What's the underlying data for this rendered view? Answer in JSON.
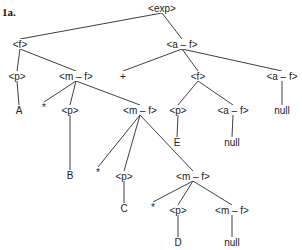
{
  "figure_label": "1a.",
  "nodes": {
    "root": {
      "label": "<exp>",
      "x": 162,
      "y": 8
    },
    "f1": {
      "label": "<f>",
      "x": 20,
      "y": 44
    },
    "af1": {
      "label": "<a – f>",
      "x": 182,
      "y": 44
    },
    "p1": {
      "label": "<p>",
      "x": 17,
      "y": 76
    },
    "mf1": {
      "label": "<m – f>",
      "x": 76,
      "y": 76
    },
    "plus": {
      "label": "+",
      "x": 123,
      "y": 76
    },
    "f2": {
      "label": "<f>",
      "x": 198,
      "y": 76
    },
    "af2": {
      "label": "<a – f>",
      "x": 282,
      "y": 76
    },
    "A": {
      "label": "A",
      "x": 19,
      "y": 110
    },
    "star1": {
      "label": "*",
      "x": 44,
      "y": 107
    },
    "p2": {
      "label": "<p>",
      "x": 70,
      "y": 110
    },
    "mf2": {
      "label": "<m – f>",
      "x": 140,
      "y": 110
    },
    "p3": {
      "label": "<p>",
      "x": 178,
      "y": 110
    },
    "af3": {
      "label": "<a – f>",
      "x": 233,
      "y": 110
    },
    "null1": {
      "label": "null",
      "x": 282,
      "y": 110
    },
    "B": {
      "label": "B",
      "x": 70,
      "y": 175
    },
    "star2": {
      "label": "*",
      "x": 98,
      "y": 172
    },
    "p4": {
      "label": "<p>",
      "x": 124,
      "y": 176
    },
    "mf3": {
      "label": "<m – f>",
      "x": 193,
      "y": 176
    },
    "E": {
      "label": "E",
      "x": 177,
      "y": 142
    },
    "null2": {
      "label": "null",
      "x": 232,
      "y": 142
    },
    "C": {
      "label": "C",
      "x": 124,
      "y": 208
    },
    "star3": {
      "label": "*",
      "x": 153,
      "y": 207
    },
    "p5": {
      "label": "<p>",
      "x": 178,
      "y": 210
    },
    "mf4": {
      "label": "<m – f>",
      "x": 232,
      "y": 210
    },
    "D": {
      "label": "D",
      "x": 178,
      "y": 242
    },
    "null3": {
      "label": "null",
      "x": 232,
      "y": 242
    }
  },
  "edges": [
    [
      "root",
      "f1"
    ],
    [
      "root",
      "af1"
    ],
    [
      "f1",
      "p1"
    ],
    [
      "f1",
      "mf1"
    ],
    [
      "p1",
      "A"
    ],
    [
      "mf1",
      "star1"
    ],
    [
      "mf1",
      "p2"
    ],
    [
      "mf1",
      "mf2"
    ],
    [
      "p2",
      "B"
    ],
    [
      "mf2",
      "star2"
    ],
    [
      "mf2",
      "p4"
    ],
    [
      "mf2",
      "mf3"
    ],
    [
      "p4",
      "C"
    ],
    [
      "mf3",
      "star3"
    ],
    [
      "mf3",
      "p5"
    ],
    [
      "mf3",
      "mf4"
    ],
    [
      "p5",
      "D"
    ],
    [
      "mf4",
      "null3"
    ],
    [
      "af1",
      "plus"
    ],
    [
      "af1",
      "f2"
    ],
    [
      "af1",
      "af2"
    ],
    [
      "f2",
      "p3"
    ],
    [
      "f2",
      "af3"
    ],
    [
      "p3",
      "E"
    ],
    [
      "af3",
      "null2"
    ],
    [
      "af2",
      "null1"
    ]
  ]
}
